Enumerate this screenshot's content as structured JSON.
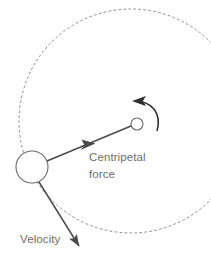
{
  "diagram": {
    "background_color": "#ffffff",
    "labels": {
      "centripetal_line1": "Centripetal",
      "centripetal_line2": "force",
      "velocity": "Velocity"
    },
    "colors": {
      "stroke": "#4a4a4a",
      "text": "#6e6e6e",
      "path_dashed": "#8d8d8d",
      "circle_fill": "#ffffff"
    },
    "elements": {
      "orbit_path": {
        "name": "dashed-circular-path",
        "center_x": 131,
        "center_y": 121,
        "radius": 112,
        "dash": "2 3"
      },
      "object_circle": {
        "name": "orbiting-object",
        "center_x": 32,
        "center_y": 167,
        "radius": 16
      },
      "center_circle": {
        "name": "rotation-center",
        "center_x": 137,
        "center_y": 124,
        "radius": 6
      },
      "centripetal_arrow": {
        "name": "centripetal-force-arrow",
        "from_x": 47,
        "from_y": 161,
        "to_x": 131,
        "to_y": 126
      },
      "velocity_arrow": {
        "name": "velocity-arrow",
        "from_x": 39,
        "from_y": 182,
        "to_x": 81,
        "to_y": 250
      },
      "rotation_arrow": {
        "name": "rotation-direction-arrow",
        "direction": "counter-clockwise"
      }
    }
  }
}
